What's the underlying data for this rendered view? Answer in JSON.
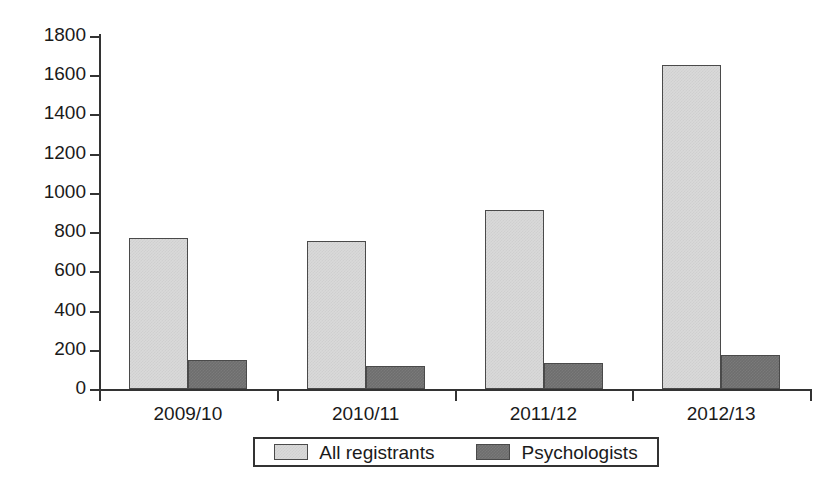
{
  "chart_data": {
    "type": "bar",
    "title": "",
    "subtitle": "",
    "xlabel": "",
    "ylabel": "",
    "categories": [
      "2009/10",
      "2010/11",
      "2011/12",
      "2012/13"
    ],
    "series": [
      {
        "name": "All registrants",
        "color": "#d9d9d9",
        "values": [
          770,
          755,
          915,
          1650
        ]
      },
      {
        "name": "Psychologists",
        "color": "#6e6e6e",
        "values": [
          148,
          115,
          132,
          172
        ]
      }
    ],
    "ylim": [
      0,
      1800
    ],
    "ytick_labels": [
      "1800",
      "1600",
      "1400",
      "1200",
      "1000",
      "800",
      "600",
      "400",
      "200",
      "0"
    ],
    "ytick_values": [
      1800,
      1600,
      1400,
      1200,
      1000,
      800,
      600,
      400,
      200,
      0
    ],
    "grid": false,
    "legend_position": "bottom"
  },
  "legend": {
    "items": [
      {
        "label": "All registrants",
        "swatch": "light-gray-swatch"
      },
      {
        "label": "Psychologists",
        "swatch": "dark-gray-swatch"
      }
    ]
  }
}
